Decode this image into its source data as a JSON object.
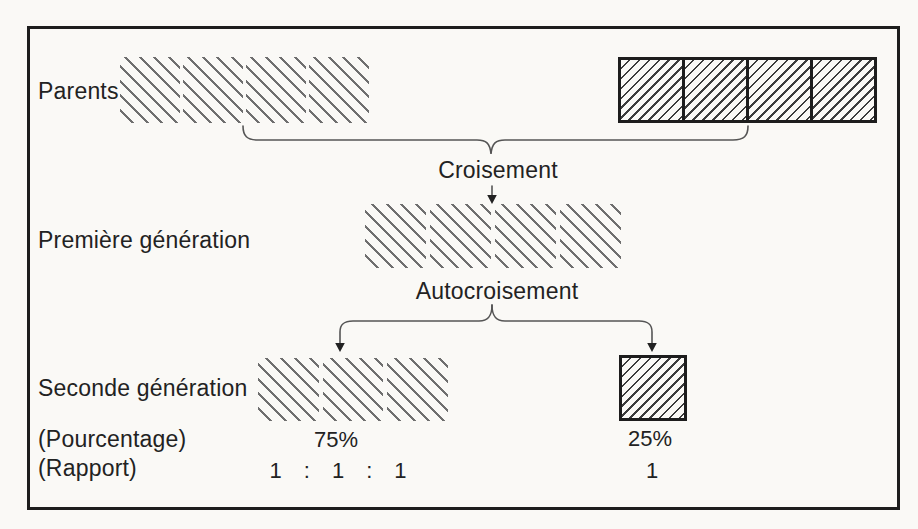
{
  "diagram": {
    "type": "genetics-cross-diagram",
    "labels": {
      "parents": "Parents",
      "first_generation": "Première génération",
      "second_generation": "Seconde génération",
      "percentage": "(Pourcentage)",
      "ratio": "(Rapport)"
    },
    "steps": {
      "cross": "Croisement",
      "self_cross": "Autocroisement"
    },
    "blocks": {
      "parent_left": {
        "segments": 4,
        "hatch": "backslash-light",
        "bordered": false
      },
      "parent_right": {
        "segments": 4,
        "hatch": "slash-dark",
        "bordered": true
      },
      "first_generation": {
        "segments": 4,
        "hatch": "backslash-light",
        "bordered": false
      },
      "second_generation_majority": {
        "segments": 3,
        "hatch": "backslash-light",
        "bordered": false
      },
      "second_generation_minority": {
        "segments": 1,
        "hatch": "slash-dark",
        "bordered": true
      }
    },
    "values": {
      "percent_majority": "75%",
      "percent_minority": "25%",
      "ratio_majority": [
        "1",
        ":",
        "1",
        ":",
        "1"
      ],
      "ratio_minority": "1"
    },
    "colors": {
      "ink": "#1d1d1d",
      "text": "#222222",
      "hatch_light": "#6f6f6f",
      "hatch_dark": "#3c3c3c",
      "connector": "#555555",
      "paper": "#faf9f6"
    }
  }
}
